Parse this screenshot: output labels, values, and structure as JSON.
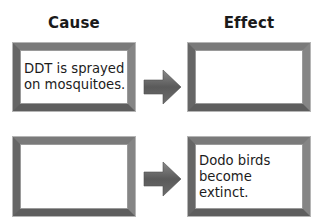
{
  "diagram": {
    "type": "cause-effect",
    "headings": {
      "cause": "Cause",
      "effect": "Effect"
    },
    "rows": [
      {
        "cause": "DDT is sprayed\non mosquitoes.",
        "effect": ""
      },
      {
        "cause": "",
        "effect": "Dodo birds\nbecome extinct."
      }
    ],
    "arrow_icon": "right-arrow-icon",
    "colors": {
      "frame": "#6e6e6e",
      "arrow": "#5f5f5f",
      "text": "#1c1c1c",
      "background": "#ffffff"
    }
  }
}
